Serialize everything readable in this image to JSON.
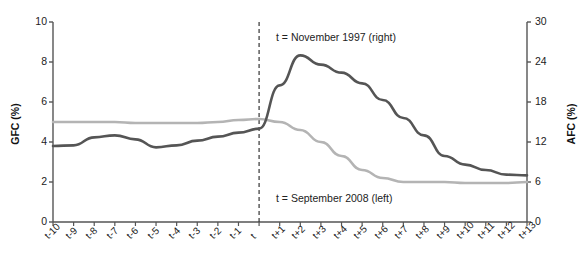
{
  "chart_data": {
    "type": "line",
    "title": "",
    "xlabel": "",
    "grid": false,
    "legend_position": "inline-annotations",
    "x": [
      "t-10",
      "t-9",
      "t-8",
      "t-7",
      "t-6",
      "t-5",
      "t-4",
      "t-3",
      "t-2",
      "t-1",
      "t",
      "t+1",
      "t+2",
      "t+3",
      "t+4",
      "t+5",
      "t+6",
      "t+7",
      "t+8",
      "t+9",
      "t+10",
      "t+11",
      "t+12",
      "t+13"
    ],
    "axes": {
      "left": {
        "label": "GFC (%)",
        "ylim": [
          0,
          10
        ],
        "ticks": [
          0,
          2,
          4,
          6,
          8,
          10
        ],
        "tick_labels": [
          "0",
          "2",
          "4",
          "6",
          "8",
          "10"
        ]
      },
      "right": {
        "label": "AFC (%)",
        "ylim": [
          0,
          30
        ],
        "ticks": [
          0,
          6,
          12,
          18,
          24,
          30
        ],
        "tick_labels": [
          "0",
          "6",
          "12",
          "18",
          "24",
          "30"
        ]
      }
    },
    "series": [
      {
        "name": "GFC (%)",
        "axis": "left",
        "color": "#b4b4b4",
        "annotation": "t = September 2008 (left)",
        "values": [
          5.0,
          5.0,
          5.0,
          5.0,
          4.95,
          4.95,
          4.95,
          4.95,
          5.0,
          5.1,
          5.15,
          5.0,
          4.6,
          4.0,
          3.3,
          2.6,
          2.2,
          2.0,
          2.0,
          2.0,
          1.95,
          1.95,
          1.95,
          2.0
        ]
      },
      {
        "name": "AFC (%)",
        "axis": "right",
        "color": "#555555",
        "annotation": "t = November 1997 (right)",
        "values": [
          11.4,
          11.5,
          12.7,
          13.0,
          12.4,
          11.2,
          11.5,
          12.2,
          12.8,
          13.4,
          14.0,
          20.5,
          25.0,
          23.6,
          22.4,
          20.8,
          18.3,
          15.6,
          13.0,
          9.9,
          8.6,
          7.8,
          7.1,
          7.0
        ]
      }
    ],
    "event_marker": {
      "at": "t",
      "style": "dashed-vertical",
      "color": "#333333"
    },
    "annotations": [
      {
        "text": "t = November 1997 (right)",
        "x": "t+0.6",
        "y_left": 9.1
      },
      {
        "text": "t = September 2008 (left)",
        "x": "t+0.6",
        "y_left": 1.35
      }
    ]
  }
}
